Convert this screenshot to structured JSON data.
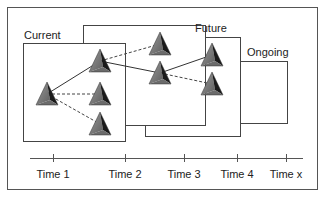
{
  "diagram": {
    "type": "temporal-network-evolution",
    "colors": {
      "frame": "#555555",
      "box": "#444444",
      "solid_link": "#333333",
      "dashed_link": "#444444",
      "pyramid_light": "#8a8a8a",
      "pyramid_mid": "#6b6b6b",
      "pyramid_dark": "#1a1a1a",
      "text": "#222222"
    },
    "boxes": [
      {
        "id": "ongoing",
        "label": "Ongoing",
        "x": 190,
        "y": 61,
        "w": 97,
        "h": 62
      },
      {
        "id": "future",
        "label": "Future",
        "x": 145,
        "y": 37,
        "w": 95,
        "h": 99
      },
      {
        "id": "middle",
        "label": "",
        "x": 83,
        "y": 25,
        "w": 122,
        "h": 100
      },
      {
        "id": "current",
        "label": "Current",
        "x": 23,
        "y": 43,
        "w": 102,
        "h": 98
      }
    ],
    "labels": {
      "current": "Current",
      "future": "Future",
      "ongoing": "Ongoing"
    },
    "nodes": [
      {
        "id": "n1",
        "x": 47,
        "y": 94
      },
      {
        "id": "n2",
        "x": 100,
        "y": 61
      },
      {
        "id": "n3",
        "x": 100,
        "y": 94
      },
      {
        "id": "n4",
        "x": 100,
        "y": 124
      },
      {
        "id": "n5",
        "x": 160,
        "y": 44
      },
      {
        "id": "n6",
        "x": 160,
        "y": 73
      },
      {
        "id": "n7",
        "x": 212,
        "y": 55
      },
      {
        "id": "n8",
        "x": 212,
        "y": 84
      }
    ],
    "links": [
      {
        "from": "n1",
        "to": "n2",
        "style": "solid"
      },
      {
        "from": "n1",
        "to": "n3",
        "style": "dashed"
      },
      {
        "from": "n1",
        "to": "n4",
        "style": "dashed"
      },
      {
        "from": "n2",
        "to": "n5",
        "style": "dashed"
      },
      {
        "from": "n2",
        "to": "n6",
        "style": "solid"
      },
      {
        "from": "n6",
        "to": "n7",
        "style": "solid"
      },
      {
        "from": "n6",
        "to": "n8",
        "style": "dashed"
      }
    ],
    "timeline": {
      "x_start": 30,
      "x_end": 303,
      "y": 158,
      "ticks": [
        {
          "label": "Time 1",
          "x": 53
        },
        {
          "label": "Time 2",
          "x": 125
        },
        {
          "label": "Time 3",
          "x": 184
        },
        {
          "label": "Time 4",
          "x": 237
        },
        {
          "label": "Time x",
          "x": 286
        }
      ]
    }
  }
}
